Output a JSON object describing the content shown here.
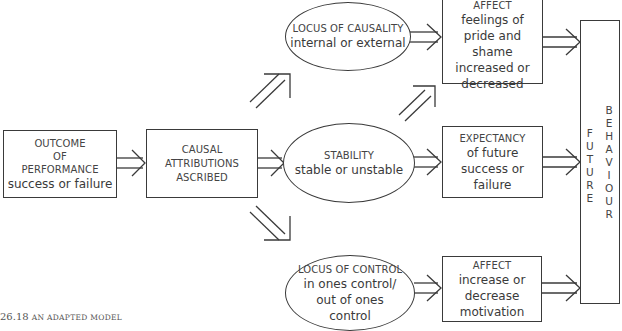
{
  "diagram": {
    "outcome": {
      "lines": [
        "OUTCOME",
        "OF",
        "PERFORMANCE"
      ],
      "detail": "success or failure"
    },
    "causal": {
      "lines": [
        "CAUSAL",
        "ATTRIBUTIONS",
        "ASCRIBED"
      ]
    },
    "locus_causality": {
      "title": "LOCUS OF CAUSALITY",
      "detail": "internal or external"
    },
    "stability": {
      "title": "STABILITY",
      "detail": "stable or unstable"
    },
    "locus_control": {
      "title": "LOCUS OF CONTROL",
      "detail": [
        "in ones control/",
        "out of ones",
        "control"
      ]
    },
    "affect_pride": {
      "title": "AFFECT",
      "detail": [
        "feelings of",
        "pride and shame",
        "increased or",
        "decreased"
      ]
    },
    "expectancy": {
      "title": "EXPECTANCY",
      "detail": [
        "of future",
        "success or",
        "failure"
      ]
    },
    "affect_motivation": {
      "title": "AFFECT",
      "detail": [
        "increase or",
        "decrease",
        "motivation"
      ]
    },
    "future_behaviour": {
      "word1": [
        "F",
        "U",
        "T",
        "U",
        "R",
        "E"
      ],
      "word2": [
        "B",
        "E",
        "H",
        "A",
        "V",
        "I",
        "O",
        "U",
        "R"
      ]
    }
  },
  "caption": {
    "number": "26.18",
    "text": "An adapted model"
  },
  "colors": {
    "line": "#3a3a3a",
    "background": "#ffffff"
  }
}
